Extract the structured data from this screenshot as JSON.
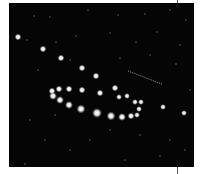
{
  "photo": {
    "description": "Star field with an arc of bright star-like dots (multiple exposure sequence) and a faint diagonal streak",
    "background_color": "#050505",
    "frame": {
      "x": 9,
      "y": 3,
      "width": 185,
      "height": 164
    },
    "bright_dots": [
      {
        "x": 18,
        "y": 37,
        "r": 3.5
      },
      {
        "x": 43,
        "y": 49,
        "r": 3.5
      },
      {
        "x": 61,
        "y": 58,
        "r": 3.5
      },
      {
        "x": 82,
        "y": 68,
        "r": 3.5
      },
      {
        "x": 96,
        "y": 76,
        "r": 3.5
      },
      {
        "x": 52,
        "y": 91,
        "r": 3.5
      },
      {
        "x": 53,
        "y": 96,
        "r": 4
      },
      {
        "x": 59,
        "y": 89,
        "r": 3.5
      },
      {
        "x": 69,
        "y": 89,
        "r": 3.5
      },
      {
        "x": 82,
        "y": 90,
        "r": 3.5
      },
      {
        "x": 100,
        "y": 93,
        "r": 3.5
      },
      {
        "x": 115,
        "y": 88,
        "r": 3.5
      },
      {
        "x": 119,
        "y": 97,
        "r": 3
      },
      {
        "x": 127,
        "y": 96,
        "r": 3
      },
      {
        "x": 60,
        "y": 100,
        "r": 4
      },
      {
        "x": 69,
        "y": 105,
        "r": 4
      },
      {
        "x": 81,
        "y": 109,
        "r": 4.5
      },
      {
        "x": 97,
        "y": 113,
        "r": 5
      },
      {
        "x": 111,
        "y": 116,
        "r": 4.5
      },
      {
        "x": 122,
        "y": 117,
        "r": 4
      },
      {
        "x": 131,
        "y": 116,
        "r": 3.5
      },
      {
        "x": 137,
        "y": 115,
        "r": 3
      },
      {
        "x": 135,
        "y": 102,
        "r": 3
      },
      {
        "x": 141,
        "y": 102,
        "r": 3
      },
      {
        "x": 139,
        "y": 109,
        "r": 3
      },
      {
        "x": 163,
        "y": 107,
        "r": 3
      },
      {
        "x": 184,
        "y": 113,
        "r": 3
      }
    ],
    "streak": {
      "x1": 128,
      "y1": 71,
      "x2": 162,
      "y2": 84
    },
    "faint_stars": [
      [
        34,
        16
      ],
      [
        50,
        17
      ],
      [
        88,
        10
      ],
      [
        118,
        15
      ],
      [
        145,
        14
      ],
      [
        170,
        10
      ],
      [
        186,
        20
      ],
      [
        27,
        40
      ],
      [
        56,
        42
      ],
      [
        76,
        36
      ],
      [
        110,
        33
      ],
      [
        136,
        42
      ],
      [
        157,
        32
      ],
      [
        180,
        45
      ],
      [
        38,
        70
      ],
      [
        70,
        60
      ],
      [
        120,
        58
      ],
      [
        150,
        55
      ],
      [
        176,
        64
      ],
      [
        190,
        90
      ],
      [
        30,
        120
      ],
      [
        55,
        115
      ],
      [
        45,
        140
      ],
      [
        90,
        140
      ],
      [
        110,
        130
      ],
      [
        140,
        135
      ],
      [
        170,
        140
      ],
      [
        25,
        164
      ],
      [
        70,
        150
      ],
      [
        125,
        160
      ],
      [
        160,
        156
      ],
      [
        185,
        150
      ]
    ]
  }
}
